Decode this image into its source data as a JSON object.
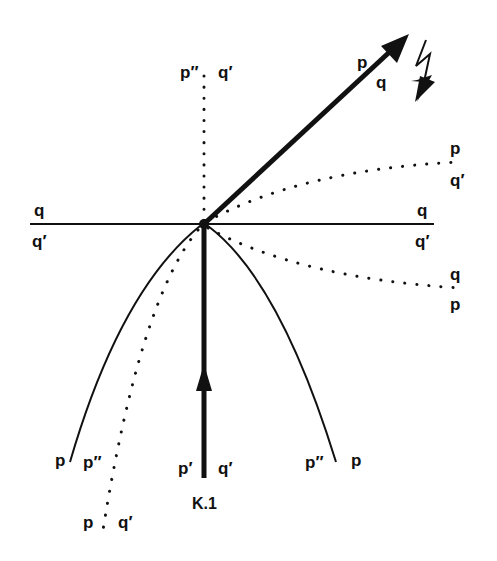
{
  "figure": {
    "caption": "K.1",
    "colors": {
      "ink": "#111111",
      "background": "#ffffff"
    }
  },
  "labels": {
    "top_vertical": {
      "left": "p′′",
      "right": "q′"
    },
    "reflected_arrow": {
      "upper": "p",
      "lower": "q"
    },
    "right_upper_dotted": {
      "upper": "p",
      "lower": "q′"
    },
    "right_horizontal": {
      "upper": "q",
      "lower": "q′"
    },
    "left_horizontal": {
      "upper": "q",
      "lower": "q′"
    },
    "right_lower_dotted": {
      "upper": "q",
      "lower": "p"
    },
    "bottom_left_solid": "p",
    "bottom_left_dotted_upper": "p′′",
    "bottom_left_dotted_lower": {
      "left": "p",
      "right": "q′"
    },
    "bottom_incoming": {
      "left": "p′",
      "right": "q′"
    },
    "bottom_right_solid": {
      "left": "p′′",
      "right": "p"
    }
  },
  "icons": {
    "lightning": "lightning-bolt-arrow-icon"
  }
}
